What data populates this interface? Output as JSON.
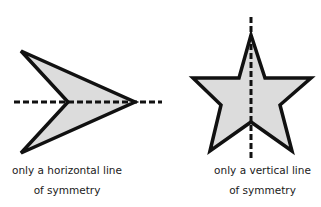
{
  "figures": [
    {
      "id": "arrowhead",
      "shape": "arrowhead",
      "fill": "#dcdcdc",
      "stroke": "#111111",
      "symmetry": "horizontal",
      "caption_line1": "only a horizontal line",
      "caption_line2": "of symmetry"
    },
    {
      "id": "star",
      "shape": "five-pointed star",
      "fill": "#dcdcdc",
      "stroke": "#111111",
      "symmetry": "vertical",
      "caption_line1": "only a vertical line",
      "caption_line2": "of symmetry"
    }
  ]
}
